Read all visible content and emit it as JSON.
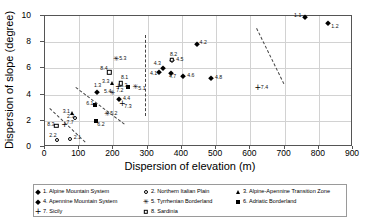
{
  "chart_data": {
    "type": "scatter",
    "title": "",
    "xlabel": "Dispersion of elevation (m)",
    "ylabel": "Dispersion of slope (degree)",
    "xlim": [
      0,
      900
    ],
    "ylim": [
      0,
      10
    ],
    "xticks": [
      "0",
      "100",
      "200",
      "300",
      "400",
      "500",
      "600",
      "700",
      "800",
      "900"
    ],
    "yticks": [
      "0",
      "2",
      "4",
      "6",
      "8",
      "10"
    ],
    "grid": "both",
    "legend_position": "below-plot",
    "series": [
      {
        "name": "1. Alpine Mountain System",
        "key": "1",
        "marker": "diamond",
        "points": [
          {
            "label": "1.1",
            "x": 760,
            "y": 9.9
          },
          {
            "label": "1.2",
            "x": 828,
            "y": 9.45
          },
          {
            "label": "1.3",
            "x": 152,
            "y": 4.2
          }
        ]
      },
      {
        "name": "2. Northern Italian Plain",
        "key": "2",
        "marker": "circle-o",
        "points": [
          {
            "label": "2.1",
            "x": 72,
            "y": 0.6
          },
          {
            "label": "2.2",
            "x": 36,
            "y": 0.55
          },
          {
            "label": "2.3",
            "x": 88,
            "y": 2.25
          }
        ]
      },
      {
        "name": "3. Alpine-Apennine Transition Zone",
        "key": "3",
        "marker": "triangle",
        "points": [
          {
            "label": "3.1",
            "x": 78,
            "y": 2.6
          },
          {
            "label": "3.3",
            "x": 196,
            "y": 4.85
          }
        ]
      },
      {
        "name": "4. Apennine Mountain System",
        "key": "4",
        "marker": "diamond",
        "points": [
          {
            "label": "4.1",
            "x": 333,
            "y": 5.7
          },
          {
            "label": "4.2",
            "x": 443,
            "y": 7.9
          },
          {
            "label": "4.3",
            "x": 344,
            "y": 6.0
          },
          {
            "label": "4.4",
            "x": 216,
            "y": 3.65
          },
          {
            "label": "4.5",
            "x": 372,
            "y": 6.65
          },
          {
            "label": "4.6",
            "x": 404,
            "y": 5.45
          },
          {
            "label": "4.7",
            "x": 368,
            "y": 5.65
          },
          {
            "label": "4.8",
            "x": 485,
            "y": 5.25
          }
        ]
      },
      {
        "name": "5. Tyrrhenian Borderland",
        "key": "5",
        "marker": "star",
        "points": [
          {
            "label": "5.1",
            "x": 264,
            "y": 4.6
          },
          {
            "label": "5.2",
            "x": 182,
            "y": 2.5
          },
          {
            "label": "5.3",
            "x": 208,
            "y": 6.75
          },
          {
            "label": "5.4",
            "x": 196,
            "y": 4.1
          }
        ]
      },
      {
        "name": "6. Adriatic Borderland",
        "key": "6",
        "marker": "square",
        "points": [
          {
            "label": "6.1",
            "x": 147,
            "y": 3.2
          },
          {
            "label": "6.2",
            "x": 150,
            "y": 2.0
          },
          {
            "label": "6.3",
            "x": 243,
            "y": 4.6
          }
        ]
      },
      {
        "name": "7. Sicily",
        "key": "7",
        "marker": "plus",
        "points": [
          {
            "label": "7.2",
            "x": 214,
            "y": 4.55
          },
          {
            "label": "7.3",
            "x": 226,
            "y": 3.25
          },
          {
            "label": "7.4",
            "x": 622,
            "y": 4.5
          },
          {
            "label": "7.7",
            "x": 57,
            "y": 1.65
          }
        ]
      },
      {
        "name": "8. Sardinia",
        "key": "8",
        "marker": "square-o",
        "points": [
          {
            "label": "8.1",
            "x": 222,
            "y": 4.85
          },
          {
            "label": "8.2",
            "x": 371,
            "y": 6.65
          },
          {
            "label": "8.3",
            "x": 33,
            "y": 1.6
          },
          {
            "label": "8.4",
            "x": 188,
            "y": 5.7
          }
        ]
      }
    ],
    "annotations": {
      "dashed_lines": [
        {
          "name": "upper-left-divider",
          "x1": 90,
          "y1": 4.6,
          "x2": 232,
          "y2": 1.8
        },
        {
          "name": "lower-left-divider",
          "x1": 15,
          "y1": 3.0,
          "x2": 118,
          "y2": 0.45
        },
        {
          "name": "vertical-divider",
          "x": 292,
          "y1": 8.55,
          "y2": 2.4
        },
        {
          "name": "right-divider",
          "x1": 620,
          "y1": 9.05,
          "x2": 700,
          "y2": 4.8
        }
      ]
    }
  },
  "legend": {
    "entries": [
      {
        "marker": "diamond",
        "label": "1. Alpine Mountain System",
        "col": 0,
        "row": 0
      },
      {
        "marker": "circle-o",
        "label": "2. Northern Italian Plain",
        "col": 1,
        "row": 0
      },
      {
        "marker": "triangle",
        "label": "3. Alpine-Apennine Transition Zone",
        "col": 2,
        "row": 0
      },
      {
        "marker": "diamond",
        "label": "4. Apennine Mountain System",
        "col": 0,
        "row": 1
      },
      {
        "marker": "star",
        "label": "5. Tyrrhenian Borderland",
        "col": 1,
        "row": 1
      },
      {
        "marker": "square",
        "label": "6. Adriatic Borderland",
        "col": 2,
        "row": 1
      },
      {
        "marker": "plus",
        "label": "7. Sicily",
        "col": 0,
        "row": 2
      },
      {
        "marker": "square-o",
        "label": "8. Sardinia",
        "col": 1,
        "row": 2
      }
    ]
  },
  "colors": {
    "marker": "#000000",
    "grid": "#d2d2d2",
    "axis": "#555555",
    "dashed": "#444444",
    "background": "#ffffff"
  }
}
